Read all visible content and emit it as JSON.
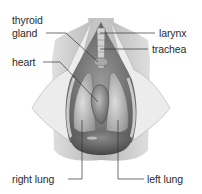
{
  "diagram": {
    "labels": {
      "thyroid_line1": "thyroid",
      "thyroid_line2": "gland",
      "larynx": "larynx",
      "trachea": "trachea",
      "heart": "heart",
      "right_lung": "right lung",
      "left_lung": "left lung"
    },
    "colors": {
      "label_text": "#2b2b2b",
      "leader_line": "#333333",
      "skin_flap": "#e6e6e6",
      "body_shadow": "#bdbdbd",
      "cavity_dark": "#6e6e6e",
      "diaphragm": "#555555"
    }
  }
}
